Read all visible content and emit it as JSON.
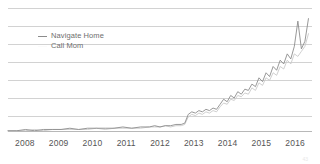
{
  "chart_data": {
    "type": "line",
    "title": "",
    "subtitle": "",
    "xlabel": "",
    "ylabel": "",
    "grid": true,
    "gridline_count": 7,
    "legend_position": "top-left",
    "xlim": [
      2008,
      2016.6
    ],
    "ylim": [
      0,
      100
    ],
    "x_tick_labels": [
      "2008",
      "2009",
      "2010",
      "2011",
      "2012",
      "2013",
      "2014",
      "2015",
      "2016"
    ],
    "y_tick_labels": [],
    "colors": {
      "navigate_home": "#8c8c8c",
      "call_mom": "#c9c9c9",
      "gridline": "#d2d2d2",
      "axis": "#b8b8b8",
      "tick_label": "#555555",
      "legend_label": "#6e6e6e"
    },
    "series": [
      {
        "name": "Navigate Home",
        "color": "#8c8c8c",
        "x": [
          2008.0,
          2008.25,
          2008.5,
          2008.75,
          2009.0,
          2009.25,
          2009.5,
          2009.75,
          2010.0,
          2010.25,
          2010.5,
          2010.75,
          2011.0,
          2011.25,
          2011.5,
          2011.75,
          2012.0,
          2012.15,
          2012.3,
          2012.45,
          2012.6,
          2012.75,
          2012.9,
          2013.0,
          2013.1,
          2013.2,
          2013.3,
          2013.4,
          2013.5,
          2013.6,
          2013.7,
          2013.8,
          2013.9,
          2014.0,
          2014.1,
          2014.2,
          2014.3,
          2014.4,
          2014.5,
          2014.6,
          2014.7,
          2014.8,
          2014.9,
          2015.0,
          2015.1,
          2015.2,
          2015.3,
          2015.4,
          2015.5,
          2015.6,
          2015.7,
          2015.8,
          2015.9,
          2016.0,
          2016.1,
          2016.2,
          2016.3,
          2016.4,
          2016.5
        ],
        "values": [
          1,
          1,
          2,
          1,
          2,
          2,
          2,
          3,
          2,
          3,
          3,
          3,
          3,
          4,
          3,
          4,
          4,
          5,
          4,
          5,
          5,
          6,
          6,
          7,
          14,
          16,
          15,
          17,
          16,
          18,
          17,
          19,
          18,
          22,
          26,
          24,
          29,
          27,
          32,
          30,
          34,
          33,
          38,
          36,
          43,
          40,
          47,
          44,
          52,
          49,
          57,
          54,
          62,
          58,
          68,
          88,
          66,
          72,
          90
        ]
      },
      {
        "name": "Call Mom",
        "color": "#c9c9c9",
        "x": [
          2008.0,
          2008.25,
          2008.5,
          2008.75,
          2009.0,
          2009.25,
          2009.5,
          2009.75,
          2010.0,
          2010.25,
          2010.5,
          2010.75,
          2011.0,
          2011.25,
          2011.5,
          2011.75,
          2012.0,
          2012.15,
          2012.3,
          2012.45,
          2012.6,
          2012.75,
          2012.9,
          2013.0,
          2013.1,
          2013.2,
          2013.3,
          2013.4,
          2013.5,
          2013.6,
          2013.7,
          2013.8,
          2013.9,
          2014.0,
          2014.1,
          2014.2,
          2014.3,
          2014.4,
          2014.5,
          2014.6,
          2014.7,
          2014.8,
          2014.9,
          2015.0,
          2015.1,
          2015.2,
          2015.3,
          2015.4,
          2015.5,
          2015.6,
          2015.7,
          2015.8,
          2015.9,
          2016.0,
          2016.1,
          2016.2,
          2016.3,
          2016.4,
          2016.5
        ],
        "values": [
          1,
          1,
          1,
          2,
          1,
          2,
          2,
          2,
          2,
          2,
          3,
          2,
          3,
          3,
          3,
          3,
          4,
          4,
          4,
          5,
          4,
          5,
          5,
          6,
          12,
          14,
          13,
          15,
          14,
          16,
          15,
          17,
          16,
          20,
          23,
          22,
          26,
          25,
          29,
          28,
          31,
          30,
          35,
          33,
          39,
          37,
          43,
          41,
          47,
          45,
          52,
          50,
          57,
          54,
          62,
          60,
          64,
          68,
          78
        ]
      }
    ]
  },
  "legend": {
    "items": [
      {
        "label": "Navigate Home",
        "marker": "line-dash"
      },
      {
        "label": "Call Mom",
        "marker": "line-dash"
      }
    ]
  },
  "artifact": {
    "corner_mark": "43"
  }
}
